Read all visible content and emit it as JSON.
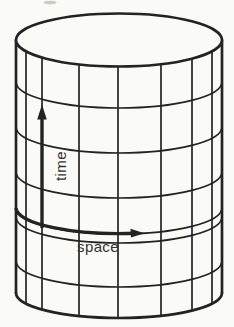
{
  "figure": {
    "kind": "cylinder-spacetime-grid-diagram",
    "axis_labels": {
      "time": "time",
      "space": "space"
    },
    "arrows": [
      {
        "name": "time-arrow",
        "direction": "up-along-cylinder-axis"
      },
      {
        "name": "space-arrow",
        "direction": "rightward-around-circumference"
      }
    ],
    "grid": {
      "vertical_meridian_lines": 9,
      "horizontal_ring_arcs": 7
    },
    "colors": {
      "paper": "#fafaf6",
      "ink": "#232323",
      "label": "#333333"
    }
  }
}
